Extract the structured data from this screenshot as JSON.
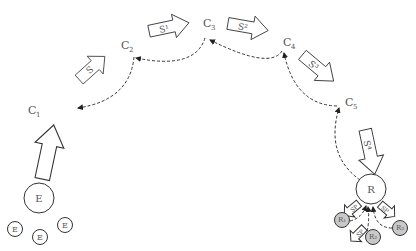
{
  "diagram": {
    "type": "state-transition-arc",
    "nodes": [
      {
        "id": "C1",
        "label": "C",
        "sub": "1",
        "x": 29,
        "y": 111
      },
      {
        "id": "C2",
        "label": "C",
        "sub": "2",
        "x": 122,
        "y": 46
      },
      {
        "id": "C3",
        "label": "C",
        "sub": "3",
        "x": 204,
        "y": 25
      },
      {
        "id": "C4",
        "label": "C",
        "sub": "4",
        "x": 284,
        "y": 44
      },
      {
        "id": "C5",
        "label": "C",
        "sub": "5",
        "x": 345,
        "y": 104
      }
    ],
    "step_arrows": [
      {
        "id": "up",
        "label": ""
      },
      {
        "id": "S1",
        "label": "S"
      },
      {
        "id": "S2",
        "label": "S¹"
      },
      {
        "id": "S3",
        "label": "S²"
      },
      {
        "id": "S4",
        "label": "S³"
      },
      {
        "id": "S5",
        "label": "S⁴"
      }
    ],
    "start_cluster": {
      "main": "E",
      "satellites": [
        "E",
        "E",
        "E"
      ]
    },
    "end_cluster": {
      "main": "R",
      "satellites": [
        "R₁",
        "R₂",
        "R₃"
      ],
      "satellite_arrow_labels": [
        "SP",
        "SP",
        "SP"
      ]
    },
    "colors": {
      "stroke": "#333333",
      "text": "#555555",
      "satellite_fill": "#c8c8c8",
      "background": "#ffffff"
    }
  }
}
